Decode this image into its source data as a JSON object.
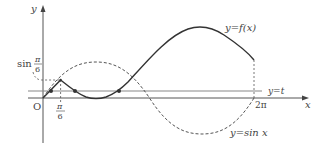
{
  "figure": {
    "axes": {
      "x_label": "x",
      "y_label": "y",
      "origin_label": "O",
      "x_ticks": [
        {
          "label_num": "π",
          "label_den": "6",
          "value": "π/6"
        },
        {
          "label": "2π",
          "value": "2π"
        }
      ],
      "y_ticks": [
        {
          "label_prefix": "sin",
          "label_num": "π",
          "label_den": "6",
          "value": "sin(π/6)"
        }
      ]
    },
    "curves": [
      {
        "name": "f",
        "label": "y=f(x)",
        "style": "solid"
      },
      {
        "name": "sin",
        "label": "y=sin x",
        "style": "dashed"
      },
      {
        "name": "t-line",
        "label": "y=t",
        "style": "solid-gray"
      }
    ],
    "colors": {
      "curve": "#333333",
      "axis": "#555555",
      "line_t": "#888888",
      "text": "#444444"
    }
  }
}
